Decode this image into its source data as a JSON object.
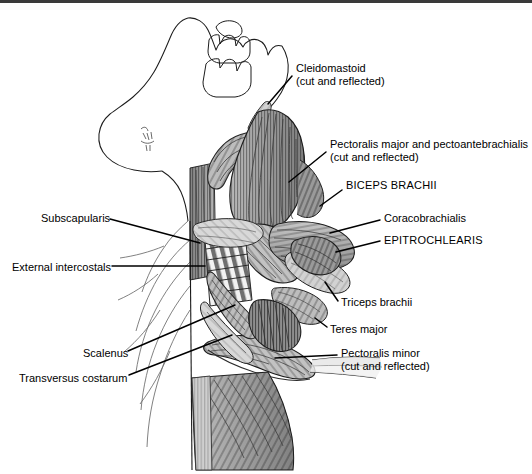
{
  "figure": {
    "view": "ventral",
    "style": "graphite pencil shaded anatomical drawing",
    "background_color": "#ffffff",
    "ink_color": "#000000",
    "border": {
      "top_rule_color": "#3a3a3a",
      "top_rule_height_px": 3
    }
  },
  "labels": [
    {
      "id": "cleidomastoid",
      "name": "Cleidomastoid",
      "qualifier": "(cut and reflected)",
      "side": "right",
      "text_x": 296,
      "text_y": 62,
      "leader": [
        [
          292,
          76
        ],
        [
          268,
          104
        ]
      ]
    },
    {
      "id": "pectoralis-major",
      "name": "Pectoralis major and pectoantebrachialis",
      "qualifier": "(cut and reflected)",
      "side": "right",
      "text_x": 330,
      "text_y": 138,
      "leader": [
        [
          326,
          152
        ],
        [
          289,
          182
        ]
      ]
    },
    {
      "id": "biceps-brachii",
      "name": "BICEPS BRACHII",
      "qualifier": "",
      "side": "right",
      "caps": true,
      "text_x": 346,
      "text_y": 179,
      "leader": [
        [
          342,
          190
        ],
        [
          320,
          206
        ]
      ]
    },
    {
      "id": "coracobrachialis",
      "name": "Coracobrachialis",
      "qualifier": "",
      "side": "right",
      "text_x": 384,
      "text_y": 212,
      "leader": [
        [
          380,
          220
        ],
        [
          330,
          233
        ]
      ]
    },
    {
      "id": "epitrochlearis",
      "name": "EPITROCHLEARIS",
      "qualifier": "",
      "side": "right",
      "caps": true,
      "text_x": 384,
      "text_y": 234,
      "leader": [
        [
          380,
          241
        ],
        [
          336,
          252
        ]
      ]
    },
    {
      "id": "triceps-brachii",
      "name": "Triceps brachii",
      "qualifier": "",
      "side": "right",
      "text_x": 341,
      "text_y": 296,
      "leader": [
        [
          338,
          301
        ],
        [
          325,
          282
        ]
      ]
    },
    {
      "id": "teres-major",
      "name": "Teres major",
      "qualifier": "",
      "side": "right",
      "text_x": 330,
      "text_y": 323,
      "leader": [
        [
          327,
          327
        ],
        [
          315,
          318
        ]
      ]
    },
    {
      "id": "pectoralis-minor",
      "name": "Pectoralis minor",
      "qualifier": "(cut and reflected)",
      "side": "right",
      "text_x": 341,
      "text_y": 347,
      "leader": [
        [
          337,
          355
        ],
        [
          275,
          358
        ]
      ]
    },
    {
      "id": "subscapularis",
      "name": "Subscapularis",
      "qualifier": "",
      "side": "left",
      "text_x": 41,
      "text_y": 212,
      "leader": [
        [
          110,
          219
        ],
        [
          200,
          243
        ]
      ]
    },
    {
      "id": "external-intercostals",
      "name": "External intercostals",
      "qualifier": "",
      "side": "left",
      "text_x": 12,
      "text_y": 261,
      "leader": [
        [
          112,
          266
        ],
        [
          205,
          266
        ]
      ]
    },
    {
      "id": "scalenus",
      "name": "Scalenus",
      "qualifier": "",
      "side": "left",
      "text_x": 83,
      "text_y": 347,
      "leader": [
        [
          128,
          351
        ],
        [
          235,
          305
        ]
      ]
    },
    {
      "id": "transversus-costarum",
      "name": "Transversus costarum",
      "qualifier": "",
      "side": "left",
      "text_x": 19,
      "text_y": 372,
      "leader": [
        [
          129,
          375
        ],
        [
          232,
          335
        ]
      ]
    }
  ]
}
